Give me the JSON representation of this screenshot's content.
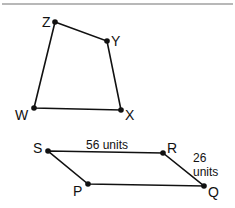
{
  "top_rule": {
    "x1": 2,
    "x2": 233,
    "y": 4,
    "color": "#a0a0a0"
  },
  "figures": [
    {
      "name": "quadrilateral-wxyz",
      "points": [
        {
          "label": "Z",
          "x": 55,
          "y": 22,
          "lx": 42,
          "ly": 27
        },
        {
          "label": "Y",
          "x": 107,
          "y": 41,
          "lx": 111,
          "ly": 46
        },
        {
          "label": "X",
          "x": 121,
          "y": 110,
          "lx": 125,
          "ly": 120
        },
        {
          "label": "W",
          "x": 34,
          "y": 108,
          "lx": 15,
          "ly": 120
        }
      ]
    },
    {
      "name": "parallelogram-pqrs",
      "points": [
        {
          "label": "S",
          "x": 48,
          "y": 151,
          "lx": 33,
          "ly": 153
        },
        {
          "label": "R",
          "x": 163,
          "y": 153,
          "lx": 167,
          "ly": 153
        },
        {
          "label": "Q",
          "x": 204,
          "y": 186,
          "lx": 208,
          "ly": 197
        },
        {
          "label": "P",
          "x": 88,
          "y": 184,
          "lx": 73,
          "ly": 196
        }
      ],
      "measures": [
        {
          "text": "56 units",
          "x": 86,
          "y": 149
        },
        {
          "text": "26",
          "x": 193,
          "y": 162
        },
        {
          "text": "units",
          "x": 193,
          "y": 176
        }
      ]
    }
  ],
  "colors": {
    "stroke": "#111111",
    "text": "#111111"
  }
}
